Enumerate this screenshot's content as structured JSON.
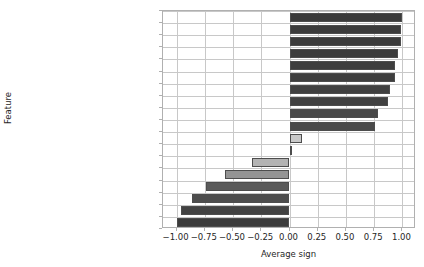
{
  "chart_data": {
    "type": "bar",
    "orientation": "horizontal",
    "title": "",
    "xlabel": "Average sign",
    "ylabel": "Feature",
    "xlim": [
      -1.12,
      1.12
    ],
    "grid": true,
    "legend": null,
    "xticks": [
      "-1.00",
      "-0.75",
      "-0.50",
      "-0.25",
      "0.00",
      "0.25",
      "0.50",
      "0.75",
      "1.00"
    ],
    "xtick_values": [
      -1.0,
      -0.75,
      -0.5,
      -0.25,
      0.0,
      0.25,
      0.5,
      0.75,
      1.0
    ],
    "categories": [
      "Maximum lesions diameter",
      "Tobacco",
      "Number of affected lymph nodes",
      "BBox CT 90th percentile",
      "Performance status",
      "PET high gray level emphasis",
      "Gender (0=F, 1=M)",
      "Chemotherapy",
      "Age",
      "Whole-body scan",
      "Alcohol",
      "4mm dilatation flatness",
      "Surgery",
      "Number of tumors",
      "16mm dilatation PET kurtosis",
      "Weight",
      "HPV status (0=-, 1=+)",
      "PET low gray level emphasis"
    ],
    "values": [
      1.0,
      0.99,
      0.99,
      0.96,
      0.93,
      0.93,
      0.89,
      0.87,
      0.78,
      0.76,
      0.11,
      0.02,
      -0.33,
      -0.57,
      -0.74,
      -0.86,
      -0.96,
      -1.0
    ],
    "bar_colors": [
      "#3b3b3b",
      "#3b3b3b",
      "#3b3b3b",
      "#3c3c3c",
      "#3e3e3e",
      "#3e3e3e",
      "#404040",
      "#414141",
      "#484848",
      "#4a4a4a",
      "#c9c9c9",
      "#ffffff",
      "#b3b3b3",
      "#949494",
      "#5a5a5a",
      "#4d4d4d",
      "#424242",
      "#3b3b3b"
    ],
    "bar_edge_color": "#4d4d4d"
  }
}
